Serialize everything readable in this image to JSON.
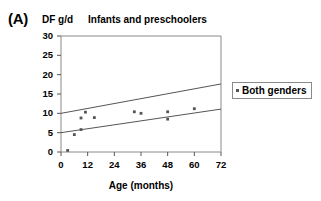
{
  "figure": {
    "panel_label": "(A)",
    "axis_unit_label": "DF g/d"
  },
  "legend": {
    "entries": [
      {
        "label": "Both genders",
        "marker": "square-dot-marker",
        "color": "#555555"
      }
    ],
    "position": "right-outside"
  },
  "chart_data": {
    "type": "scatter",
    "title": "Infants and preschoolers",
    "xlabel": "Age (months)",
    "ylabel": "DF g/d",
    "xlim": [
      0,
      72
    ],
    "ylim": [
      0,
      30
    ],
    "xticks": [
      0,
      12,
      24,
      36,
      48,
      60,
      72
    ],
    "yticks": [
      0,
      5,
      10,
      15,
      20,
      25,
      30
    ],
    "xtick_labels": [
      "0",
      "12",
      "24",
      "36",
      "48",
      "60",
      "72"
    ],
    "ytick_labels": [
      "0",
      "5",
      "10",
      "15",
      "20",
      "25",
      "30"
    ],
    "grid": false,
    "series": [
      {
        "name": "Both genders",
        "marker": "dot",
        "color": "#555555",
        "points": [
          {
            "x": 3,
            "y": 0.4
          },
          {
            "x": 6,
            "y": 4.5
          },
          {
            "x": 9,
            "y": 5.8
          },
          {
            "x": 9,
            "y": 8.8
          },
          {
            "x": 11,
            "y": 10.3
          },
          {
            "x": 15,
            "y": 8.9
          },
          {
            "x": 33,
            "y": 10.4
          },
          {
            "x": 36,
            "y": 10.0
          },
          {
            "x": 48,
            "y": 10.4
          },
          {
            "x": 48,
            "y": 8.5
          },
          {
            "x": 60,
            "y": 11.2
          }
        ]
      }
    ],
    "trend_lines": [
      {
        "name": "upper-confidence-line",
        "x0": 0,
        "y0": 10.0,
        "x1": 72,
        "y1": 17.6,
        "color": "#555555"
      },
      {
        "name": "lower-confidence-line",
        "x0": 0,
        "y0": 5.0,
        "x1": 72,
        "y1": 11.1,
        "color": "#555555"
      }
    ]
  }
}
